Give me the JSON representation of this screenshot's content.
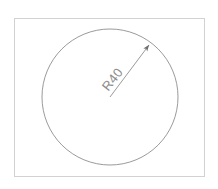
{
  "drawing": {
    "title": "Circle with radius dimension",
    "background_color": "#ffffff",
    "frame": {
      "name": "drawing-frame",
      "x": 14.5,
      "y": 18.5,
      "width": 190,
      "height": 158,
      "stroke_color": "#d2d2d2",
      "stroke_width": 1,
      "fill": "none"
    },
    "shapes": [
      {
        "name": "circle",
        "type": "circle",
        "cx": 110,
        "cy": 97,
        "r": 68,
        "stroke_color": "#8f8f8f",
        "stroke_width": 0.9,
        "fill": "none"
      }
    ],
    "dimensions": [
      {
        "name": "radius-dimension",
        "type": "radius",
        "label": "R40",
        "value": 40,
        "prefix": "R",
        "leader": {
          "x1": 110,
          "y1": 97,
          "x2": 150,
          "y2": 44,
          "stroke_color": "#8f8f8f",
          "stroke_width": 0.9
        },
        "arrowhead": {
          "at_x": 150,
          "at_y": 44,
          "size": 6,
          "fill": "#6e6e6e"
        },
        "text": {
          "x": 116,
          "y": 82,
          "rotation_deg": -52,
          "color": "#8c8c8c",
          "font_size": 13
        }
      }
    ]
  }
}
